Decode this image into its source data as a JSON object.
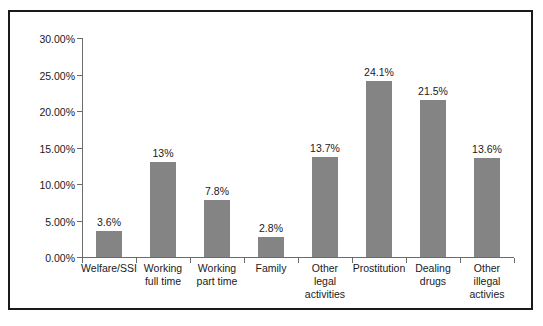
{
  "chart_data": {
    "type": "bar",
    "title": "",
    "subtitle": "",
    "xlabel": "",
    "ylabel": "",
    "grid": false,
    "legend": false,
    "ylim": [
      0,
      30
    ],
    "ytick_step": 5,
    "ytick_labels": [
      "0.00%",
      "5.00%",
      "10.00%",
      "15.00%",
      "20.00%",
      "25.00%",
      "30.00%"
    ],
    "ytick_values": [
      0,
      5,
      10,
      15,
      20,
      25,
      30
    ],
    "categories": [
      "Welfare/SSI",
      "Working\nfull time",
      "Working\npart time",
      "Family",
      "Other\nlegal\nactivities",
      "Prostitution",
      "Dealing\ndrugs",
      "Other\nillegal\nactivies"
    ],
    "values": [
      3.6,
      13,
      7.8,
      2.8,
      13.7,
      24.1,
      21.5,
      13.6
    ],
    "data_labels": [
      "3.6%",
      "13%",
      "7.8%",
      "2.8%",
      "13.7%",
      "24.1%",
      "21.5%",
      "13.6%"
    ],
    "series": [
      {
        "name": "",
        "values": [
          3.6,
          13,
          7.8,
          2.8,
          13.7,
          24.1,
          21.5,
          13.6
        ]
      }
    ],
    "colors": {
      "bar_fill": "#848484",
      "axis": "#6b6b6b",
      "frame": "#1a1a1a",
      "text": "#1a1a1a",
      "background": "#ffffff"
    }
  }
}
